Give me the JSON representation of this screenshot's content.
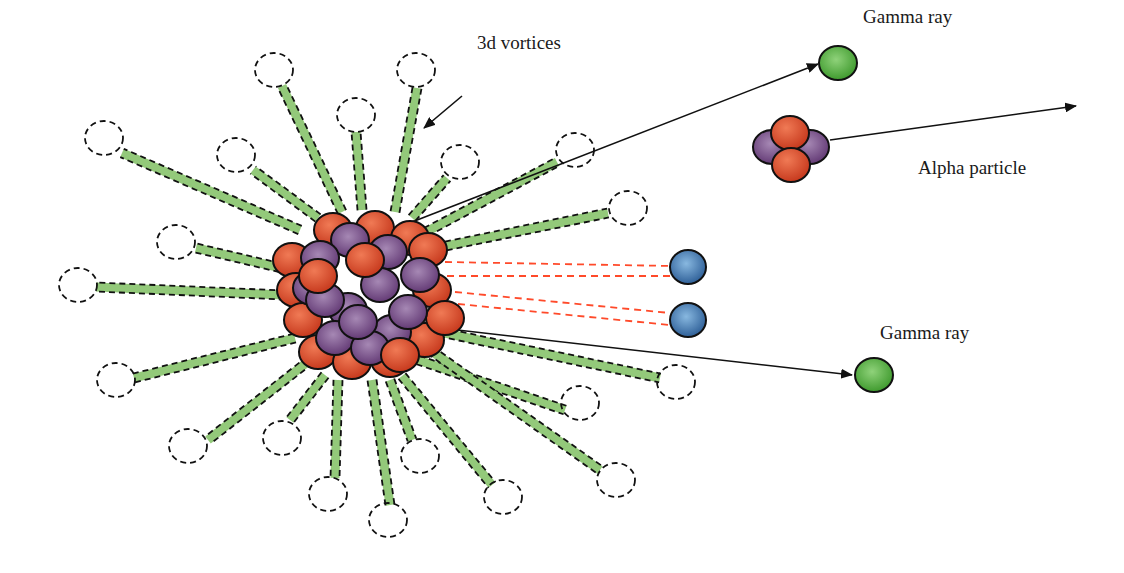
{
  "diagram": {
    "labels": {
      "vortices": "3d vortices",
      "gamma_top": "Gamma ray",
      "alpha": "Alpha particle",
      "gamma_bottom": "Gamma ray"
    },
    "colors": {
      "proton": "#d8472a",
      "neutron": "#7a4a86",
      "gamma": "#5cb043",
      "electron": "#4f86b8",
      "vortex": "#93c97a",
      "dashed_red": "#ff4a2a",
      "outline": "#111111"
    },
    "nucleus": {
      "cx": 360,
      "cy": 295
    },
    "vortices": [
      {
        "x": 275,
        "y": 15
      },
      {
        "x": 444,
        "y": 70
      },
      {
        "x": 414,
        "y": 25
      },
      {
        "x": 356,
        "y": 115
      },
      {
        "x": 283,
        "y": 15
      }
    ]
  }
}
